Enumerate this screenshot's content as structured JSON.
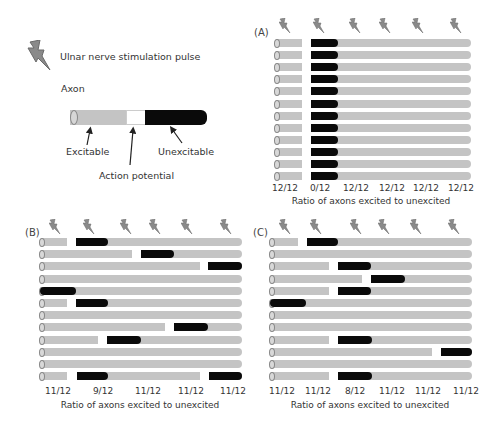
{
  "legend": {
    "pulse_label": "Ulnar nerve stimulation pulse",
    "axon_title": "Axon",
    "excitable_label": "Excitable",
    "action_potential_label": "Action potential",
    "unexcitable_label": "Unexcitable",
    "colors": {
      "excitable": "#c4c4c4",
      "action_potential": "#ffffff",
      "unexcitable": "#0a0a0a",
      "bolt": "#8a8a8a"
    }
  },
  "panels": [
    {
      "id": "A",
      "label": "(A)",
      "ratios": [
        "12/12",
        "0/12",
        "12/12",
        "12/12",
        "12/12",
        "12/12"
      ],
      "caption": "Ratio of axons excited to unexcited"
    },
    {
      "id": "B",
      "label": "(B)",
      "ratios": [
        "11/12",
        "9/12",
        "11/12",
        "11/12",
        "11/12"
      ],
      "caption": "Ratio of axons excited to unexcited"
    },
    {
      "id": "C",
      "label": "(C)",
      "ratios": [
        "11/12",
        "11/12",
        "8/12",
        "11/12",
        "11/12",
        "11/12"
      ],
      "caption": "Ratio of axons excited to unexcited"
    }
  ],
  "chart_data": {
    "type": "diagram",
    "panels": {
      "A": {
        "pulses": 6,
        "axons": 12,
        "ratios_excited_to_unexcited": [
          "12/12",
          "0/12",
          "12/12",
          "12/12",
          "12/12",
          "12/12"
        ]
      },
      "B": {
        "pulses": 6,
        "axons": 12,
        "ratios_excited_to_unexcited": [
          "11/12",
          "9/12",
          "11/12",
          "11/12",
          "11/12"
        ]
      },
      "C": {
        "pulses": 6,
        "axons": 12,
        "ratios_excited_to_unexcited": [
          "11/12",
          "11/12",
          "8/12",
          "11/12",
          "11/12",
          "11/12"
        ]
      }
    },
    "xlabel": "Ratio of axons excited to unexcited"
  }
}
